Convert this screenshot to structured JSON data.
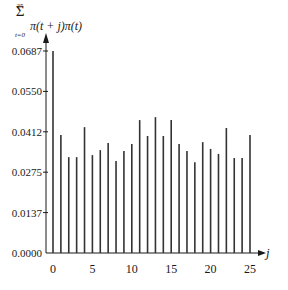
{
  "chart_data": {
    "type": "bar",
    "subtype": "stem",
    "title": "",
    "ylabel": "sum_{t=0}^{25} π(t + j)π(t)",
    "ylabel_parts": {
      "sum_symbol": "Σ",
      "upper": "25",
      "lower": "t=0",
      "expr": "π(t + j)π(t)"
    },
    "xlabel": "j",
    "x": [
      0,
      1,
      2,
      3,
      4,
      5,
      6,
      7,
      8,
      9,
      10,
      11,
      12,
      13,
      14,
      15,
      16,
      17,
      18,
      19,
      20,
      21,
      22,
      23,
      24,
      25
    ],
    "values": [
      0.0687,
      0.0401,
      0.0326,
      0.0326,
      0.0428,
      0.0333,
      0.035,
      0.0374,
      0.0313,
      0.0347,
      0.0371,
      0.0452,
      0.0398,
      0.0462,
      0.0398,
      0.0452,
      0.0371,
      0.0347,
      0.0309,
      0.0377,
      0.0354,
      0.0337,
      0.0425,
      0.0323,
      0.0323,
      0.0401
    ],
    "yticks": [
      "0.0000",
      "0.0137",
      "0.0275",
      "0.0412",
      "0.0550",
      "0.0687"
    ],
    "ytick_values": [
      0.0,
      0.01374,
      0.02748,
      0.04122,
      0.05496,
      0.0687
    ],
    "xticks": [
      "0",
      "5",
      "10",
      "15",
      "20",
      "25"
    ],
    "xtick_values": [
      0,
      5,
      10,
      15,
      20,
      25
    ],
    "ylim": [
      0,
      0.0687
    ],
    "xlim": [
      0,
      25
    ],
    "grid": false,
    "legend": null,
    "colors": {
      "bar": "#333333",
      "axis": "#1a1a1a"
    }
  }
}
